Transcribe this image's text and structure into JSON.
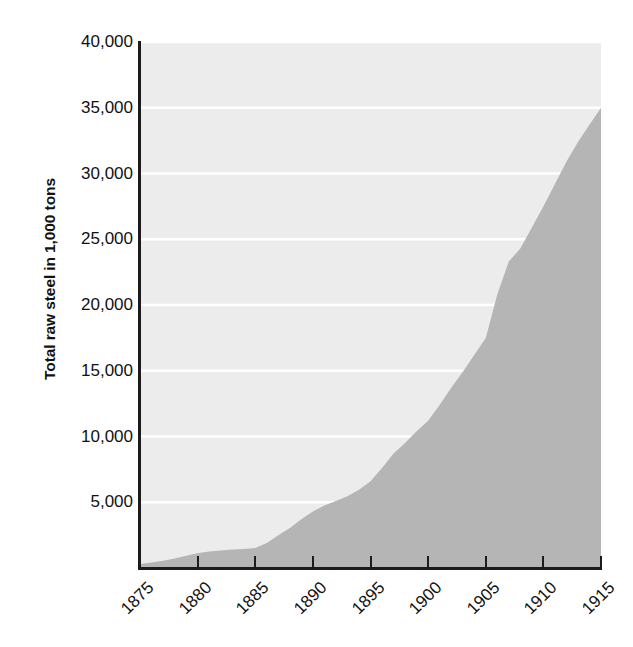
{
  "chart_data": {
    "type": "area",
    "title": "",
    "subtitle": "",
    "xlabel": "",
    "ylabel": "Total raw steel in 1,000 tons",
    "xlim": [
      1875,
      1915
    ],
    "ylim": [
      0,
      40000
    ],
    "grid": true,
    "legend": null,
    "x_tick_labels": [
      "1875",
      "1880",
      "1885",
      "1890",
      "1895",
      "1900",
      "1905",
      "1910",
      "1915"
    ],
    "y_tick_labels": [
      "5,000",
      "10,000",
      "15,000",
      "20,000",
      "25,000",
      "30,000",
      "35,000",
      "40,000"
    ],
    "y_tick_values": [
      5000,
      10000,
      15000,
      20000,
      25000,
      30000,
      35000,
      40000
    ],
    "x": [
      1875,
      1876,
      1877,
      1878,
      1879,
      1880,
      1881,
      1882,
      1883,
      1884,
      1885,
      1886,
      1887,
      1888,
      1889,
      1890,
      1891,
      1892,
      1893,
      1894,
      1895,
      1896,
      1897,
      1898,
      1899,
      1900,
      1901,
      1902,
      1903,
      1904,
      1905,
      1906,
      1907,
      1908,
      1909,
      1910,
      1911,
      1912,
      1913,
      1914,
      1915
    ],
    "values": [
      300,
      420,
      560,
      730,
      930,
      1120,
      1250,
      1330,
      1400,
      1450,
      1520,
      1900,
      2500,
      3050,
      3700,
      4300,
      4750,
      5100,
      5450,
      5950,
      6600,
      7600,
      8700,
      9500,
      10400,
      11200,
      12400,
      13700,
      14900,
      16200,
      17500,
      20800,
      23300,
      24300,
      25900,
      27500,
      29200,
      30900,
      32400,
      33700,
      35000
    ],
    "series_name": "Total raw steel",
    "colors": {
      "area_fill": "#b5b5b5",
      "plot_background": "#ececec",
      "gridline": "#ffffff",
      "axis_line": "#1b1b1b",
      "text": "#111111",
      "page_background": "#ffffff"
    }
  },
  "axes": {
    "y_title": "Total raw steel in 1,000 tons"
  }
}
